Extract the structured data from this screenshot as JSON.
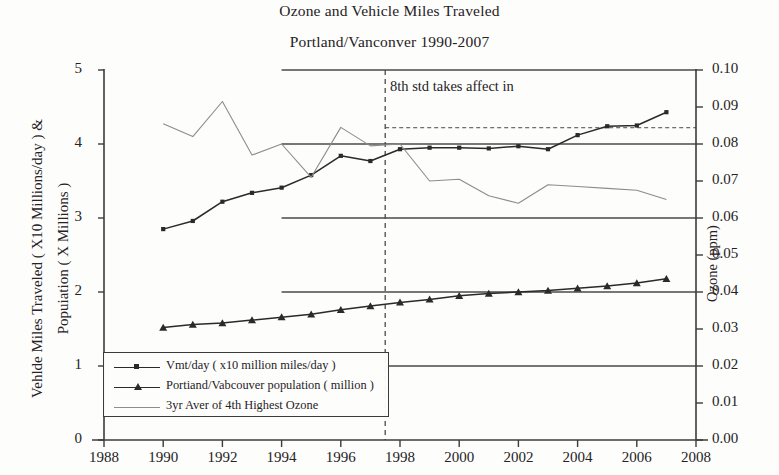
{
  "title": {
    "line1": "Ozone and Vehicle Miles Traveled",
    "line2": "Portland/Vanconver 1990-2007"
  },
  "axes": {
    "y_left_label_1": "Vehlde Miles Traveled ( X10 Millions/day ) &",
    "y_left_label_2": "Popuiation ( X Millions )",
    "y_right_label": "Ozone (ppm)",
    "x_label": "",
    "y_left_ticks": [
      "0",
      "1",
      "2",
      "3",
      "4",
      "5"
    ],
    "y_right_ticks": [
      "0.00",
      "0.01",
      "0.02",
      "0.03",
      "0.04",
      "0.05",
      "0.06",
      "0.07",
      "0.08",
      "0.09",
      "0.10"
    ],
    "x_ticks": [
      "1988",
      "1990",
      "1992",
      "1994",
      "1996",
      "1998",
      "2000",
      "2002",
      "2004",
      "2006",
      "2008"
    ]
  },
  "annotation": {
    "text": "8th std takes affect in",
    "marker_year": 1997.5
  },
  "legend": {
    "items": [
      {
        "label": "Vmt/day  ( x10 million miles/day )",
        "marker": "diamond-marker",
        "color": "#2a2a2a"
      },
      {
        "label": "Portiand/Vabcouver population  ( million )",
        "marker": "triangle-marker",
        "color": "#2a2a2a"
      },
      {
        "label": "3yr Aver of 4th Highest Ozone",
        "marker": "plain-line",
        "color": "#8e8e8e"
      }
    ]
  },
  "colors": {
    "vmt": "#2a2a2a",
    "population": "#2a2a2a",
    "ozone": "#8c8c8c",
    "reference": "#4a4a4a",
    "axis": "#3b3b3b",
    "dashed": "#4a4a4a"
  },
  "chart_data": {
    "type": "line",
    "xlabel": "Year",
    "ylabel": "Vehicle Miles Traveled (X10 Millions/day) & Population (X Millions)",
    "y2label": "Ozone (ppm)",
    "xlim": [
      1988,
      2008
    ],
    "ylim": [
      0,
      5
    ],
    "y2lim": [
      0.0,
      0.1
    ],
    "grid": false,
    "legend_position": "lower-left",
    "x": [
      1990,
      1991,
      1992,
      1993,
      1994,
      1995,
      1996,
      1997,
      1998,
      1999,
      2000,
      2001,
      2002,
      2003,
      2004,
      2005,
      2006,
      2007
    ],
    "series": [
      {
        "name": "Vmt/day  ( x10 million miles/day )",
        "axis": "left",
        "marker": "diamond",
        "values": [
          2.85,
          2.96,
          3.22,
          3.34,
          3.41,
          3.58,
          3.84,
          3.77,
          3.93,
          3.95,
          3.95,
          3.94,
          3.97,
          3.93,
          4.12,
          4.24,
          4.25,
          4.43
        ]
      },
      {
        "name": "Portiand/Vabcouver population  ( million )",
        "axis": "left",
        "marker": "triangle",
        "values": [
          1.52,
          1.56,
          1.58,
          1.62,
          1.66,
          1.7,
          1.76,
          1.81,
          1.86,
          1.9,
          1.95,
          1.98,
          2.0,
          2.02,
          2.05,
          2.08,
          2.12,
          2.18
        ]
      },
      {
        "name": "3yr Aver of 4th Highest Ozone",
        "axis": "right",
        "marker": "none",
        "values": [
          0.0855,
          0.082,
          0.0915,
          0.077,
          0.08,
          0.071,
          0.0845,
          0.0795,
          0.08,
          0.07,
          0.0705,
          0.066,
          0.064,
          0.069,
          0.0685,
          0.068,
          0.0675,
          0.065
        ]
      }
    ],
    "reference_lines": [
      {
        "name": "ref-5.0",
        "y_left": 5.0,
        "y_right": 0.1,
        "x_start": 1994,
        "x_end": 2008,
        "style": "solid"
      },
      {
        "name": "ref-4.0",
        "y_left": 4.0,
        "y_right": 0.08,
        "x_start": 1994,
        "x_end": 2008,
        "style": "solid"
      },
      {
        "name": "ref-3.0",
        "y_left": 3.0,
        "y_right": 0.06,
        "x_start": 1994,
        "x_end": 2008,
        "style": "solid"
      },
      {
        "name": "ref-2.0",
        "y_left": 2.0,
        "y_right": 0.04,
        "x_start": 1994,
        "x_end": 2008,
        "style": "solid"
      },
      {
        "name": "ref-1.0",
        "y_left": 1.0,
        "y_right": 0.02,
        "x_start": 1997.5,
        "x_end": 2008,
        "style": "solid"
      },
      {
        "name": "std-8th-0.084",
        "y_left": 4.22,
        "y_right": 0.084,
        "x_start": 1997.5,
        "x_end": 2008,
        "style": "dashed"
      }
    ],
    "vertical_marker": {
      "name": "8th-std-year",
      "x": 1997.5,
      "style": "dashed",
      "label": "8th std takes affect in"
    }
  }
}
